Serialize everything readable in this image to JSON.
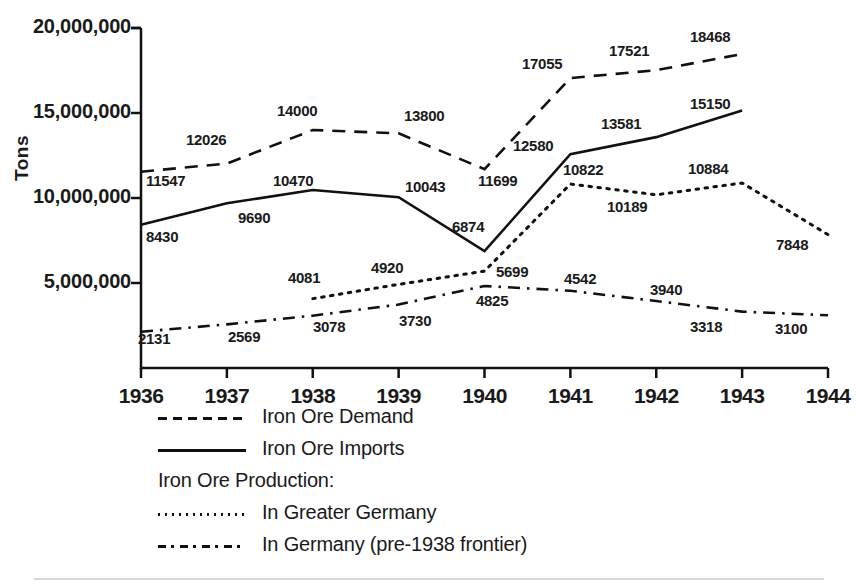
{
  "figure": {
    "ylabel": "Tons",
    "y_ticks": [
      "20,000,000",
      "15,000,000",
      "10,000,000",
      "5,000,000"
    ],
    "x_ticks": [
      "1936",
      "1937",
      "1938",
      "1939",
      "1940",
      "1941",
      "1942",
      "1943",
      "1944"
    ]
  },
  "legend": {
    "items": [
      {
        "label": "Iron Ore Demand",
        "key": "dashed"
      },
      {
        "label": "Iron Ore Imports",
        "key": "solid"
      },
      {
        "label": "Iron Ore Production:",
        "key": "none"
      },
      {
        "label": "In Greater Germany",
        "key": "dotted"
      },
      {
        "label": "In Germany (pre-1938 frontier)",
        "key": "dashdot"
      }
    ]
  },
  "colors": {
    "ink": "#111111",
    "background": "#ffffff",
    "rule": "#d8d8d8"
  },
  "chart_data": {
    "type": "line",
    "title": "",
    "xlabel": "",
    "ylabel": "Tons",
    "x": [
      1936,
      1937,
      1938,
      1939,
      1940,
      1941,
      1942,
      1943,
      1944
    ],
    "ylim": [
      0,
      20000000
    ],
    "yticks": [
      5000000,
      10000000,
      15000000,
      20000000
    ],
    "value_units": "thousands of tons",
    "grid": false,
    "legend_position": "below-axes-left",
    "series": [
      {
        "name": "Iron Ore Demand",
        "style": "dashed",
        "x": [
          1936,
          1937,
          1938,
          1939,
          1940,
          1941,
          1942,
          1943
        ],
        "values": [
          11547,
          12026,
          14000,
          13800,
          11699,
          17055,
          17521,
          18468
        ],
        "labels": [
          "11547",
          "12026",
          "14000",
          "13800",
          "11699",
          "17055",
          "17521",
          "18468"
        ]
      },
      {
        "name": "Iron Ore Imports",
        "style": "solid",
        "x": [
          1936,
          1937,
          1938,
          1939,
          1940,
          1941,
          1942,
          1943
        ],
        "values": [
          8430,
          9690,
          10470,
          10043,
          6874,
          12580,
          13581,
          15150
        ],
        "labels": [
          "8430",
          "9690",
          "10470",
          "10043",
          "6874",
          "12580",
          "13581",
          "15150"
        ]
      },
      {
        "name": "In Greater Germany",
        "style": "dotted",
        "x": [
          1938,
          1939,
          1940,
          1941,
          1942,
          1943,
          1944
        ],
        "values": [
          4081,
          4920,
          5699,
          10822,
          10189,
          10884,
          7848
        ],
        "labels": [
          "4081",
          "4920",
          "5699",
          "10822",
          "10189",
          "10884",
          "7848"
        ]
      },
      {
        "name": "In Germany (pre-1938 frontier)",
        "style": "dashdot",
        "x": [
          1936,
          1937,
          1938,
          1939,
          1940,
          1941,
          1942,
          1943,
          1944
        ],
        "values": [
          2131,
          2569,
          3078,
          3730,
          4825,
          4542,
          3940,
          3318,
          3100
        ],
        "labels": [
          "2131",
          "2569",
          "3078",
          "3730",
          "4825",
          "4542",
          "3940",
          "3318",
          "3100"
        ]
      }
    ],
    "data_labels": [
      {
        "text": "11547",
        "series": "Iron Ore Demand",
        "year": 1936,
        "x": 146,
        "y": 172
      },
      {
        "text": "12026",
        "series": "Iron Ore Demand",
        "year": 1937,
        "x": 186,
        "y": 131
      },
      {
        "text": "14000",
        "series": "Iron Ore Demand",
        "year": 1938,
        "x": 277,
        "y": 102
      },
      {
        "text": "13800",
        "series": "Iron Ore Demand",
        "year": 1939,
        "x": 404,
        "y": 107
      },
      {
        "text": "11699",
        "series": "Iron Ore Demand",
        "year": 1940,
        "x": 478,
        "y": 172
      },
      {
        "text": "17055",
        "series": "Iron Ore Demand",
        "year": 1941,
        "x": 522,
        "y": 55
      },
      {
        "text": "17521",
        "series": "Iron Ore Demand",
        "year": 1942,
        "x": 609,
        "y": 42
      },
      {
        "text": "18468",
        "series": "Iron Ore Demand",
        "year": 1943,
        "x": 690,
        "y": 28
      },
      {
        "text": "8430",
        "series": "Iron Ore Imports",
        "year": 1936,
        "x": 146,
        "y": 228
      },
      {
        "text": "9690",
        "series": "Iron Ore Imports",
        "year": 1937,
        "x": 238,
        "y": 209
      },
      {
        "text": "10470",
        "series": "Iron Ore Imports",
        "year": 1938,
        "x": 273,
        "y": 172
      },
      {
        "text": "10043",
        "series": "Iron Ore Imports",
        "year": 1939,
        "x": 405,
        "y": 178
      },
      {
        "text": "6874",
        "series": "Iron Ore Imports",
        "year": 1940,
        "x": 452,
        "y": 218
      },
      {
        "text": "12580",
        "series": "Iron Ore Imports",
        "year": 1941,
        "x": 513,
        "y": 137
      },
      {
        "text": "13581",
        "series": "Iron Ore Imports",
        "year": 1942,
        "x": 601,
        "y": 115
      },
      {
        "text": "15150",
        "series": "Iron Ore Imports",
        "year": 1943,
        "x": 690,
        "y": 95
      },
      {
        "text": "4081",
        "series": "In Greater Germany",
        "year": 1938,
        "x": 288,
        "y": 269
      },
      {
        "text": "4920",
        "series": "In Greater Germany",
        "year": 1939,
        "x": 371,
        "y": 259
      },
      {
        "text": "5699",
        "series": "In Greater Germany",
        "year": 1940,
        "x": 496,
        "y": 263
      },
      {
        "text": "10822",
        "series": "In Greater Germany",
        "year": 1941,
        "x": 563,
        "y": 161
      },
      {
        "text": "10189",
        "series": "In Greater Germany",
        "year": 1942,
        "x": 607,
        "y": 198
      },
      {
        "text": "10884",
        "series": "In Greater Germany",
        "year": 1943,
        "x": 688,
        "y": 160
      },
      {
        "text": "7848",
        "series": "In Greater Germany",
        "year": 1944,
        "x": 776,
        "y": 236
      },
      {
        "text": "2131",
        "series": "In Germany (pre-1938 frontier)",
        "year": 1936,
        "x": 138,
        "y": 330
      },
      {
        "text": "2569",
        "series": "In Germany (pre-1938 frontier)",
        "year": 1937,
        "x": 228,
        "y": 328
      },
      {
        "text": "3078",
        "series": "In Germany (pre-1938 frontier)",
        "year": 1938,
        "x": 313,
        "y": 318
      },
      {
        "text": "3730",
        "series": "In Germany (pre-1938 frontier)",
        "year": 1939,
        "x": 399,
        "y": 312
      },
      {
        "text": "4825",
        "series": "In Germany (pre-1938 frontier)",
        "year": 1940,
        "x": 476,
        "y": 292
      },
      {
        "text": "4542",
        "series": "In Germany (pre-1938 frontier)",
        "year": 1941,
        "x": 564,
        "y": 270
      },
      {
        "text": "3940",
        "series": "In Germany (pre-1938 frontier)",
        "year": 1942,
        "x": 650,
        "y": 281
      },
      {
        "text": "3318",
        "series": "In Germany (pre-1938 frontier)",
        "year": 1943,
        "x": 690,
        "y": 318
      },
      {
        "text": "3100",
        "series": "In Germany (pre-1938 frontier)",
        "year": 1944,
        "x": 775,
        "y": 320
      }
    ]
  }
}
